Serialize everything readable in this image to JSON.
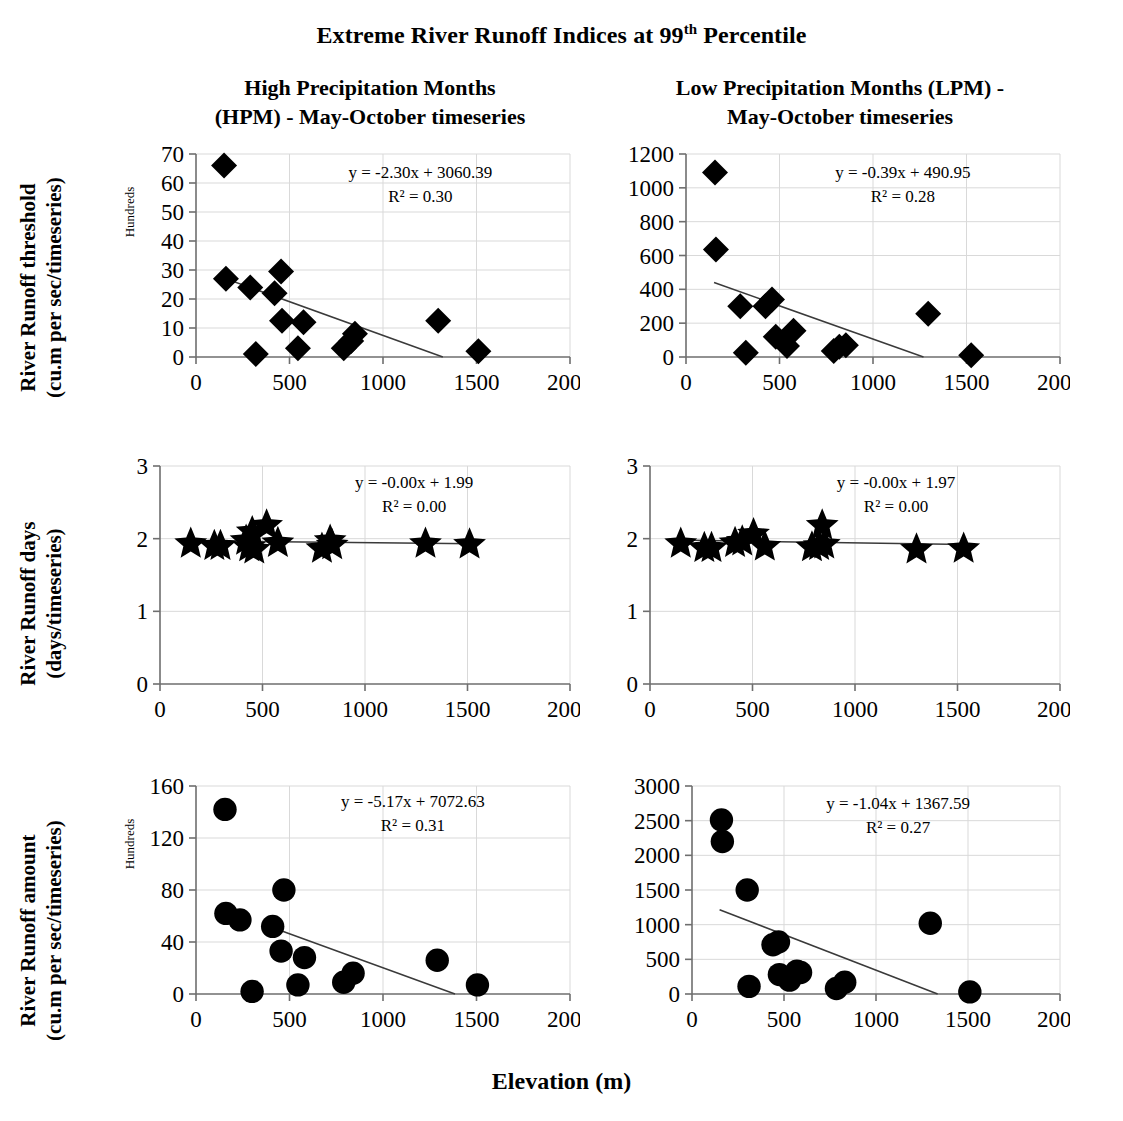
{
  "figure": {
    "title_main": "Extreme River Runoff Indices at 99",
    "title_sup": "th",
    "title_tail": " Percentile",
    "x_axis_label": "Elevation (m)",
    "column_titles": [
      {
        "line1": "High Precipitation Months",
        "line2": "(HPM) - May-October timeseries"
      },
      {
        "line1": "Low Precipitation Months (LPM) -",
        "line2": "May-October timeseries"
      }
    ],
    "row_labels": [
      {
        "line1": "River Runoff threshold",
        "line2": "(cu.m per sec/timeseries)"
      },
      {
        "line1": "River Runoff days",
        "line2": "(days/timeseries)"
      },
      {
        "line1": "River Runoff amount",
        "line2": "(cu.m per sec/timeseries)"
      }
    ]
  },
  "chart_data": [
    {
      "id": "hpm-threshold",
      "type": "scatter",
      "title": "High Precipitation Months (HPM) - May-October timeseries",
      "row": "River Runoff threshold (cu.m per sec/timeseries)",
      "xlabel": "Elevation (m)",
      "ylabel": "River Runoff threshold (cu.m per sec/timeseries)",
      "y_units_note": "Hundreds",
      "marker": "diamond",
      "xlim": [
        0,
        2000
      ],
      "ylim": [
        0,
        70
      ],
      "xticks": [
        0,
        500,
        1000,
        1500,
        2000
      ],
      "yticks": [
        0,
        10,
        20,
        30,
        40,
        50,
        60,
        70
      ],
      "grid": true,
      "equation": "y = -2.30x + 3060.39",
      "r_squared_label": "R² = 0.30",
      "r_squared": 0.3,
      "slope": -2.3,
      "intercept": 3060.39,
      "trendline_x": [
        150,
        1320
      ],
      "trendline_y": [
        27.2,
        0
      ],
      "points": [
        {
          "x": 150,
          "y": 66
        },
        {
          "x": 160,
          "y": 27
        },
        {
          "x": 290,
          "y": 24
        },
        {
          "x": 320,
          "y": 1
        },
        {
          "x": 420,
          "y": 22
        },
        {
          "x": 455,
          "y": 29.5
        },
        {
          "x": 460,
          "y": 12.5
        },
        {
          "x": 545,
          "y": 3
        },
        {
          "x": 575,
          "y": 12
        },
        {
          "x": 790,
          "y": 3
        },
        {
          "x": 830,
          "y": 5.5
        },
        {
          "x": 850,
          "y": 8
        },
        {
          "x": 1295,
          "y": 12.5
        },
        {
          "x": 1510,
          "y": 2
        }
      ]
    },
    {
      "id": "lpm-threshold",
      "type": "scatter",
      "title": "Low Precipitation Months (LPM) - May-October timeseries",
      "row": "River Runoff threshold (cu.m per sec/timeseries)",
      "xlabel": "Elevation (m)",
      "ylabel": "River Runoff threshold (cu.m per sec/timeseries)",
      "y_units_note": "",
      "marker": "diamond",
      "xlim": [
        0,
        2000
      ],
      "ylim": [
        0,
        1200
      ],
      "xticks": [
        0,
        500,
        1000,
        1500,
        2000
      ],
      "yticks": [
        0,
        200,
        400,
        600,
        800,
        1000,
        1200
      ],
      "grid": true,
      "equation": "y = -0.39x + 490.95",
      "r_squared_label": "R² = 0.28",
      "r_squared": 0.28,
      "slope": -0.39,
      "intercept": 490.95,
      "trendline_x": [
        150,
        1270
      ],
      "trendline_y": [
        440,
        0
      ],
      "points": [
        {
          "x": 155,
          "y": 1090
        },
        {
          "x": 160,
          "y": 635
        },
        {
          "x": 290,
          "y": 300
        },
        {
          "x": 320,
          "y": 25
        },
        {
          "x": 425,
          "y": 300
        },
        {
          "x": 460,
          "y": 340
        },
        {
          "x": 480,
          "y": 120
        },
        {
          "x": 540,
          "y": 65
        },
        {
          "x": 575,
          "y": 155
        },
        {
          "x": 790,
          "y": 35
        },
        {
          "x": 820,
          "y": 60
        },
        {
          "x": 855,
          "y": 70
        },
        {
          "x": 1295,
          "y": 255
        },
        {
          "x": 1525,
          "y": 10
        }
      ]
    },
    {
      "id": "hpm-days",
      "type": "scatter",
      "title": "High Precipitation Months (HPM) - May-October timeseries",
      "row": "River Runoff days (days/timeseries)",
      "xlabel": "Elevation (m)",
      "ylabel": "River Runoff days (days/timeseries)",
      "y_units_note": "",
      "marker": "star",
      "xlim": [
        0,
        2000
      ],
      "ylim": [
        0,
        3
      ],
      "xticks": [
        0,
        500,
        1000,
        1500,
        2000
      ],
      "yticks": [
        0,
        1,
        2,
        3
      ],
      "grid": true,
      "equation": "y = -0.00x + 1.99",
      "r_squared_label": "R² = 0.00",
      "r_squared": 0.0,
      "slope": -0.0,
      "intercept": 1.99,
      "trendline_x": [
        140,
        1530
      ],
      "trendline_y": [
        1.97,
        1.93
      ],
      "points": [
        {
          "x": 150,
          "y": 1.93
        },
        {
          "x": 265,
          "y": 1.9
        },
        {
          "x": 295,
          "y": 1.9
        },
        {
          "x": 420,
          "y": 1.97
        },
        {
          "x": 435,
          "y": 1.88
        },
        {
          "x": 450,
          "y": 2.09
        },
        {
          "x": 460,
          "y": 1.85
        },
        {
          "x": 520,
          "y": 2.18
        },
        {
          "x": 575,
          "y": 1.94
        },
        {
          "x": 790,
          "y": 1.86
        },
        {
          "x": 830,
          "y": 1.97
        },
        {
          "x": 840,
          "y": 1.91
        },
        {
          "x": 1295,
          "y": 1.93
        },
        {
          "x": 1510,
          "y": 1.92
        }
      ]
    },
    {
      "id": "lpm-days",
      "type": "scatter",
      "title": "Low Precipitation Months (LPM) - May-October timeseries",
      "row": "River Runoff days (days/timeseries)",
      "xlabel": "Elevation (m)",
      "ylabel": "River Runoff days (days/timeseries)",
      "y_units_note": "",
      "marker": "star",
      "xlim": [
        0,
        2000
      ],
      "ylim": [
        0,
        3
      ],
      "xticks": [
        0,
        500,
        1000,
        1500,
        2000
      ],
      "yticks": [
        0,
        1,
        2,
        3
      ],
      "grid": true,
      "equation": "y = -0.00x + 1.97",
      "r_squared_label": "R² = 0.00",
      "r_squared": 0.0,
      "slope": -0.0,
      "intercept": 1.97,
      "trendline_x": [
        140,
        1540
      ],
      "trendline_y": [
        1.98,
        1.92
      ],
      "points": [
        {
          "x": 150,
          "y": 1.93
        },
        {
          "x": 265,
          "y": 1.87
        },
        {
          "x": 300,
          "y": 1.87
        },
        {
          "x": 415,
          "y": 1.94
        },
        {
          "x": 450,
          "y": 1.96
        },
        {
          "x": 505,
          "y": 2.06
        },
        {
          "x": 560,
          "y": 1.89
        },
        {
          "x": 790,
          "y": 1.88
        },
        {
          "x": 825,
          "y": 1.9
        },
        {
          "x": 840,
          "y": 2.18
        },
        {
          "x": 850,
          "y": 1.92
        },
        {
          "x": 1300,
          "y": 1.85
        },
        {
          "x": 1530,
          "y": 1.86
        }
      ]
    },
    {
      "id": "hpm-amount",
      "type": "scatter",
      "title": "High Precipitation Months (HPM) - May-October timeseries",
      "row": "River Runoff amount (cu.m per sec/timeseries)",
      "xlabel": "Elevation (m)",
      "ylabel": "River Runoff amount (cu.m per sec/timeseries)",
      "y_units_note": "Hundreds",
      "marker": "circle",
      "xlim": [
        0,
        2000
      ],
      "ylim": [
        0,
        160
      ],
      "xticks": [
        0,
        500,
        1000,
        1500,
        2000
      ],
      "yticks": [
        0,
        40,
        80,
        120,
        160
      ],
      "grid": true,
      "equation": "y = -5.17x + 7072.63",
      "r_squared_label": "R² = 0.31",
      "r_squared": 0.31,
      "slope": -5.17,
      "intercept": 7072.63,
      "trendline_x": [
        430,
        1385
      ],
      "trendline_y": [
        50,
        0
      ],
      "points": [
        {
          "x": 155,
          "y": 142
        },
        {
          "x": 160,
          "y": 62
        },
        {
          "x": 235,
          "y": 57
        },
        {
          "x": 300,
          "y": 2
        },
        {
          "x": 410,
          "y": 52
        },
        {
          "x": 455,
          "y": 33
        },
        {
          "x": 470,
          "y": 80
        },
        {
          "x": 545,
          "y": 7
        },
        {
          "x": 580,
          "y": 28
        },
        {
          "x": 790,
          "y": 9
        },
        {
          "x": 840,
          "y": 16
        },
        {
          "x": 1290,
          "y": 26
        },
        {
          "x": 1505,
          "y": 7
        }
      ]
    },
    {
      "id": "lpm-amount",
      "type": "scatter",
      "title": "Low Precipitation Months (LPM) - May-October timeseries",
      "row": "River Runoff amount (cu.m per sec/timeseries)",
      "xlabel": "Elevation (m)",
      "ylabel": "River Runoff amount (cu.m per sec/timeseries)",
      "y_units_note": "",
      "marker": "circle",
      "xlim": [
        0,
        2000
      ],
      "ylim": [
        0,
        3000
      ],
      "xticks": [
        0,
        500,
        1000,
        1500,
        2000
      ],
      "yticks": [
        0,
        500,
        1000,
        1500,
        2000,
        2500,
        3000
      ],
      "grid": true,
      "equation": "y = -1.04x + 1367.59",
      "r_squared_label": "R² = 0.27",
      "r_squared": 0.27,
      "slope": -1.04,
      "intercept": 1367.59,
      "trendline_x": [
        150,
        1335
      ],
      "trendline_y": [
        1215,
        0
      ],
      "points": [
        {
          "x": 160,
          "y": 2510
        },
        {
          "x": 165,
          "y": 2200
        },
        {
          "x": 300,
          "y": 1500
        },
        {
          "x": 310,
          "y": 110
        },
        {
          "x": 440,
          "y": 710
        },
        {
          "x": 470,
          "y": 750
        },
        {
          "x": 475,
          "y": 280
        },
        {
          "x": 530,
          "y": 200
        },
        {
          "x": 570,
          "y": 330
        },
        {
          "x": 590,
          "y": 310
        },
        {
          "x": 785,
          "y": 80
        },
        {
          "x": 830,
          "y": 170
        },
        {
          "x": 1295,
          "y": 1020
        },
        {
          "x": 1510,
          "y": 30
        }
      ]
    }
  ]
}
